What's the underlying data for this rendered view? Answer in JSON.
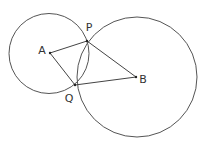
{
  "diagram": {
    "type": "geometry",
    "colors": {
      "background": "#ffffff",
      "stroke": "#555555",
      "text": "#333333"
    },
    "circles": [
      {
        "name": "circle-A",
        "center": "A",
        "cx": 49,
        "cy": 53.5,
        "r": 40
      },
      {
        "name": "circle-B",
        "center": "B",
        "cx": 137,
        "cy": 77,
        "r": 60
      }
    ],
    "points": {
      "A": {
        "label": "A",
        "x": 50,
        "y": 53,
        "label_x": 42,
        "label_y": 51
      },
      "P": {
        "label": "P",
        "x": 87,
        "y": 41,
        "label_x": 89,
        "label_y": 28
      },
      "Q": {
        "label": "Q",
        "x": 75,
        "y": 85,
        "label_x": 69,
        "label_y": 99
      },
      "B": {
        "label": "B",
        "x": 136,
        "y": 77,
        "label_x": 143,
        "label_y": 80
      }
    },
    "segments": [
      {
        "name": "segment-AP",
        "from": "A",
        "to": "P"
      },
      {
        "name": "segment-AQ",
        "from": "A",
        "to": "Q"
      },
      {
        "name": "segment-PB",
        "from": "P",
        "to": "B"
      },
      {
        "name": "segment-QB",
        "from": "Q",
        "to": "B"
      }
    ]
  }
}
